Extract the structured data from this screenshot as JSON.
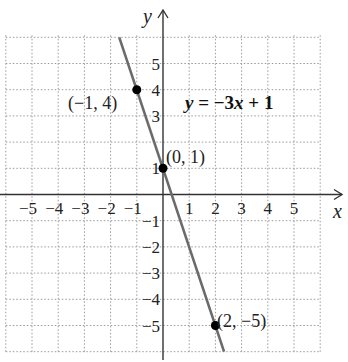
{
  "chart_data": {
    "type": "line",
    "title": "",
    "xlabel": "x",
    "ylabel": "y",
    "xlim": [
      -6,
      6
    ],
    "ylim": [
      -6,
      6
    ],
    "grid": true,
    "grid_style": "dotted",
    "x_ticks": [
      -5,
      -4,
      -3,
      -2,
      -1,
      1,
      2,
      3,
      4,
      5
    ],
    "y_ticks": [
      -5,
      -4,
      -3,
      -2,
      -1,
      1,
      3,
      4,
      5
    ],
    "x_tick_labels": [
      "−5",
      "−4",
      "−3",
      "−2",
      "−1",
      "1",
      "2",
      "3",
      "4",
      "5"
    ],
    "y_tick_labels": [
      "−5",
      "−4",
      "−3",
      "−2",
      "−1",
      "1",
      "3",
      "4",
      "5"
    ],
    "series": [
      {
        "name": "y = −3x + 1",
        "equation": "y = -3x + 1",
        "slope": -3,
        "intercept": 1,
        "x": [
          -1.67,
          2.33
        ],
        "y": [
          6,
          -6
        ],
        "color": "#6b6b6b"
      }
    ],
    "points": [
      {
        "x": -1,
        "y": 4,
        "label": "(−1, 4)"
      },
      {
        "x": 0,
        "y": 1,
        "label": "(0, 1)"
      },
      {
        "x": 2,
        "y": -5,
        "label": "(2, −5)"
      }
    ],
    "annotations": [
      {
        "text": "y = −3x + 1",
        "position": "upper-right"
      }
    ]
  },
  "labels": {
    "x_axis": "x",
    "y_axis": "y",
    "equation_y": "y",
    "equation_eq": " = −3",
    "equation_x": "x",
    "equation_rest": " + 1",
    "point_a": "(−1, 4)",
    "point_b": "(0, 1)",
    "point_c": "(2, −5)"
  }
}
